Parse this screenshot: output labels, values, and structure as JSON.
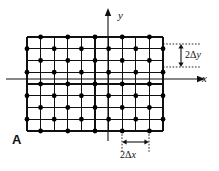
{
  "figure": {
    "panel_label": "A",
    "background_color": "#ffffff",
    "line_color": "#111111",
    "dot_color": "#000000",
    "axes": {
      "x_label": "x",
      "y_label": "y",
      "x_axis_y": 79,
      "y_axis_x": 108,
      "x_axis_start": 6,
      "x_axis_end": 199,
      "y_axis_start": 14,
      "y_axis_end": 141,
      "arrow_size": 5
    },
    "lattice": {
      "left": 27,
      "right": 163,
      "top": 37,
      "bottom": 131,
      "n_vertical_lines": 11,
      "n_horizontal_lines": 9,
      "dx": 13.6,
      "dy": 11.75,
      "dot_radius": 2.4,
      "pattern": "checkerboard",
      "grid_line_width": 1.1
    },
    "annotations": {
      "dy": {
        "label_plain": "2Δy",
        "prefix": "2",
        "delta": "Δ",
        "variable": "y",
        "guide_top_y": 44,
        "guide_bottom_y": 67,
        "guide_x_start": 163,
        "guide_x_end": 200,
        "arrow_x": 181
      },
      "dx": {
        "label_plain": "2Δx",
        "prefix": "2",
        "delta": "Δ",
        "variable": "x",
        "guide_left_x": 122,
        "guide_right_x": 149,
        "guide_y_start": 131,
        "guide_y_end": 152,
        "arrow_y": 142
      }
    }
  }
}
